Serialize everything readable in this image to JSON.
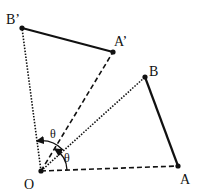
{
  "diagram": {
    "points": {
      "O": {
        "label": "O",
        "x": 41,
        "y": 171
      },
      "A": {
        "label": "A",
        "x": 178,
        "y": 166
      },
      "B": {
        "label": "B",
        "x": 145,
        "y": 77
      },
      "A_prime": {
        "label": "A’",
        "x": 113,
        "y": 52
      },
      "B_prime": {
        "label": "B’",
        "x": 22,
        "y": 28
      }
    },
    "segments": [
      {
        "from": "A",
        "to": "B",
        "style": "solid"
      },
      {
        "from": "A_prime",
        "to": "B_prime",
        "style": "solid"
      },
      {
        "from": "O",
        "to": "A",
        "style": "dashed"
      },
      {
        "from": "O",
        "to": "A_prime",
        "style": "dashed"
      },
      {
        "from": "O",
        "to": "B",
        "style": "dotted"
      },
      {
        "from": "O",
        "to": "B_prime",
        "style": "dotted"
      }
    ],
    "angles": [
      {
        "label": "θ",
        "between": [
          "OB",
          "OB_prime"
        ]
      },
      {
        "label": "θ",
        "between": [
          "OA",
          "OA_prime"
        ]
      }
    ],
    "colors": {
      "stroke": "#111111",
      "background": "#ffffff"
    }
  }
}
